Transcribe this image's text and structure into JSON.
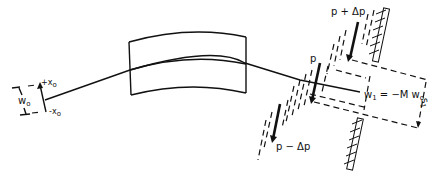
{
  "diagram": {
    "type": "beam-optics-schematic",
    "labels": {
      "plus_x0": "+x",
      "plus_x0_sub": "o",
      "minus_x0": "-x",
      "minus_x0_sub": "o",
      "w0": "w",
      "w0_sub": "o",
      "p": "p",
      "p_plus": "p + Δp",
      "p_minus": "p − Δp",
      "w1": "w",
      "w1_sub": "1",
      "w1_eq": " = −M w",
      "w1_eq_sub": "o",
      "s1": "s",
      "s1_sub": "1"
    },
    "colors": {
      "ink": "#111111",
      "background": "#ffffff"
    }
  }
}
